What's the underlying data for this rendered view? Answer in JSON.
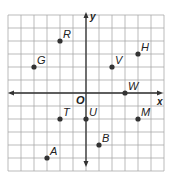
{
  "diagram": {
    "type": "coordinate-plane",
    "grid": {
      "xmin": -6,
      "xmax": 6,
      "ymin": -6,
      "ymax": 6,
      "step": 1
    },
    "axes": {
      "x_label": "x",
      "y_label": "y",
      "origin_label": "O"
    },
    "colors": {
      "grid": "#a9a9a9",
      "axis": "#333333",
      "point": "#333333",
      "label": "#222222"
    },
    "points": [
      {
        "name": "R",
        "x": -2,
        "y": 4
      },
      {
        "name": "G",
        "x": -4,
        "y": 2
      },
      {
        "name": "H",
        "x": 4,
        "y": 3
      },
      {
        "name": "V",
        "x": 2,
        "y": 2
      },
      {
        "name": "W",
        "x": 3,
        "y": 0
      },
      {
        "name": "T",
        "x": -2,
        "y": -2
      },
      {
        "name": "U",
        "x": 0,
        "y": -2
      },
      {
        "name": "M",
        "x": 4,
        "y": -2
      },
      {
        "name": "B",
        "x": 1,
        "y": -4
      },
      {
        "name": "A",
        "x": -3,
        "y": -5
      }
    ]
  }
}
